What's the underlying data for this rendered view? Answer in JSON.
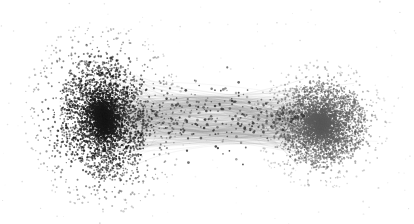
{
  "figure": {
    "kind": "network-graph",
    "title": "",
    "background_color": "#ffffff",
    "width": 414,
    "height": 224,
    "layout_algorithm": "force-directed",
    "edge_style": "bundled-curved",
    "has_axes": false,
    "has_legend": false,
    "has_labels": false
  },
  "chart_data": {
    "type": "scatter",
    "title": "",
    "subtitle": "",
    "xlabel": "",
    "ylabel": "",
    "xlim": [
      0,
      414
    ],
    "ylim": [
      0,
      224
    ],
    "grid": false,
    "legend_position": "none",
    "annotations": [],
    "background": "#ffffff",
    "node_color_dark": "#1a1a1a",
    "node_color_mid": "#5c5c5c",
    "edge_color": "#d9d9d9",
    "clusters": [
      {
        "name": "left-cluster",
        "cx": 104,
        "cy": 118,
        "rx": 44,
        "ry": 62,
        "core_rx": 20,
        "core_ry": 34,
        "node_count": 5200,
        "core_color": "#151515",
        "halo_color": "#2b2b2b",
        "node_radius": 0.85,
        "density_falloff": 2.3,
        "scatter_count": 620,
        "scatter_rx": 88,
        "scatter_ry": 104,
        "rotation_deg": -8
      },
      {
        "name": "right-cluster",
        "cx": 321,
        "cy": 124,
        "rx": 46,
        "ry": 42,
        "core_rx": 30,
        "core_ry": 27,
        "node_count": 4600,
        "core_color": "#575757",
        "halo_color": "#6d6d6d",
        "node_radius": 0.8,
        "density_falloff": 1.55,
        "scatter_count": 430,
        "scatter_rx": 74,
        "scatter_ry": 70,
        "rotation_deg": 4
      }
    ],
    "bridge": {
      "name": "edge-bundle-bridge",
      "x_start": 118,
      "x_end": 305,
      "y_center": 116,
      "spread": 38,
      "edge_count": 340,
      "edge_color": "#dddddd",
      "edge_width": 0.45,
      "bridge_node_count": 360,
      "bridge_node_color": "#3a3a3a"
    },
    "stray_nodes": {
      "count": 150,
      "color": "#bdbdbd",
      "radius": 0.7
    }
  }
}
